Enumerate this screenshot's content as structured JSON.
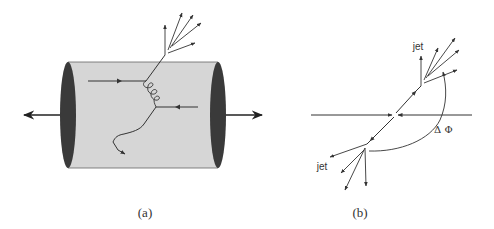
{
  "figure": {
    "panels": [
      {
        "id": "a",
        "caption": "(a)",
        "description": "Detector cylinder with parton collision producing a jet and a gluon exchange"
      },
      {
        "id": "b",
        "caption": "(b)",
        "description": "Transverse view of dijet event with azimuthal separation",
        "labels": {
          "jet_upper": "jet",
          "jet_lower": "jet",
          "delta_phi": "Δ Φ"
        }
      }
    ],
    "colors": {
      "cylinder_fill": "#d6d6d6",
      "cylinder_edge": "#555555",
      "end_cap": "#3a3a3a",
      "line": "#333333"
    }
  }
}
